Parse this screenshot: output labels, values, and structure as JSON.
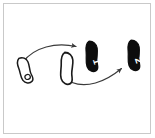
{
  "figure": {
    "background_color": "#ffffff",
    "frame_color": "#c9c9c9",
    "outline_color": "#1a1a1a",
    "fill_black": "#0d0d0d",
    "fill_white": "#ffffff",
    "arrow_color": "#3a3a3a",
    "shapes": [
      {
        "id": "shape-1",
        "name": "outlined-shape-left",
        "style": "outline",
        "label": "",
        "x": 25,
        "y": 70,
        "rotation": -28
      },
      {
        "id": "shape-2",
        "name": "outlined-shape-middle",
        "style": "outline",
        "label": "",
        "x": 67,
        "y": 68,
        "rotation": -8
      },
      {
        "id": "shape-3",
        "name": "filled-shape-one",
        "style": "filled",
        "label": "1",
        "x": 92,
        "y": 56,
        "rotation": -12
      },
      {
        "id": "shape-4",
        "name": "filled-shape-two",
        "style": "filled",
        "label": "2",
        "x": 134,
        "y": 55,
        "rotation": -12
      }
    ],
    "arrows": [
      {
        "id": "arrow-1",
        "name": "arrow-upper-left-to-right",
        "from": "shape-1",
        "to": "shape-3",
        "start_x": 23,
        "start_y": 62,
        "end_x": 79,
        "end_y": 47
      },
      {
        "id": "arrow-2",
        "name": "arrow-lower-left-to-right",
        "from": "shape-2",
        "to": "shape-4",
        "start_x": 72,
        "start_y": 82,
        "end_x": 124,
        "end_y": 66
      }
    ]
  }
}
